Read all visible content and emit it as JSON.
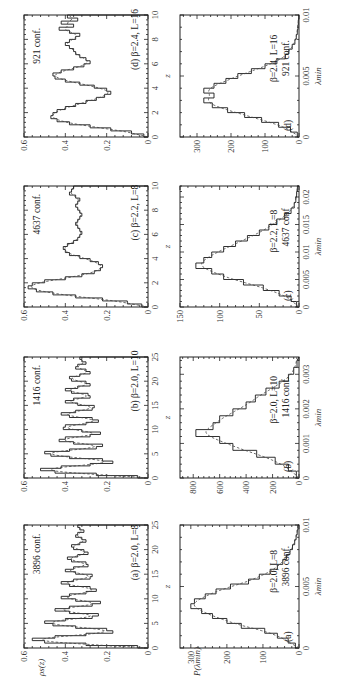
{
  "figure": {
    "rotation": "90deg counter-clockwise",
    "layout": "4 panel pairs (a)-(d), each with spectral density rho_s(z) and distribution P(lambda_min)"
  },
  "axes_labels": {
    "rho_ylabel": "ρs(z)",
    "rho_xlabel": "z",
    "p_ylabel": "P(λmin)",
    "p_xlabel": "λmin"
  },
  "chart_data": [
    {
      "type": "line",
      "panel": "(a)",
      "title": "β=2.0, L=8",
      "annotation": "3896 conf.",
      "xlabel": "z",
      "ylabel": "ρs(z)",
      "xlim": [
        0,
        25
      ],
      "ylim": [
        0,
        0.6
      ],
      "xticks": [
        0,
        5,
        10,
        15,
        20,
        25
      ],
      "yticks": [
        0,
        0.2,
        0.4,
        0.6
      ],
      "series": [
        {
          "name": "histogram",
          "x": [
            0,
            0.5,
            1,
            1.5,
            2,
            2.5,
            3,
            3.5,
            4,
            4.5,
            5,
            5.5,
            6,
            6.5,
            7,
            7.5,
            8,
            8.5,
            9,
            9.5,
            10,
            10.5,
            11,
            11.5,
            12,
            12.5,
            13,
            13.5,
            14,
            14.5,
            15,
            15.5,
            16,
            16.5,
            17,
            17.5,
            18,
            18.5,
            19,
            19.5,
            20,
            20.5,
            21,
            21.5,
            22,
            22.5,
            23,
            23.5,
            24,
            24.5
          ],
          "values": [
            0.05,
            0.3,
            0.5,
            0.56,
            0.45,
            0.3,
            0.17,
            0.2,
            0.35,
            0.46,
            0.5,
            0.4,
            0.27,
            0.24,
            0.38,
            0.45,
            0.38,
            0.27,
            0.23,
            0.35,
            0.42,
            0.38,
            0.3,
            0.25,
            0.28,
            0.38,
            0.42,
            0.36,
            0.28,
            0.27,
            0.35,
            0.4,
            0.36,
            0.29,
            0.3,
            0.37,
            0.39,
            0.34,
            0.29,
            0.31,
            0.36,
            0.37,
            0.33,
            0.3,
            0.32,
            0.35,
            0.34,
            0.31,
            0.33,
            0.34
          ]
        },
        {
          "name": "fit (dashed)",
          "style": "dashed"
        }
      ]
    },
    {
      "type": "bar",
      "panel": "(a)",
      "title": "β=2.0, L=8",
      "annotation": "3896 conf.",
      "xlabel": "λmin",
      "ylabel": "P(λmin)",
      "xlim": [
        0,
        0.01
      ],
      "ylim": [
        0,
        330
      ],
      "xticks": [
        0,
        0.005,
        0.01
      ],
      "yticks": [
        0,
        100,
        200,
        300
      ],
      "x": [
        0.0002,
        0.0006,
        0.001,
        0.0014,
        0.0018,
        0.0022,
        0.0026,
        0.003,
        0.0034,
        0.0038,
        0.0042,
        0.0046,
        0.005,
        0.0054,
        0.0058,
        0.0062,
        0.0066,
        0.007,
        0.0074,
        0.0078,
        0.0082,
        0.0086,
        0.009,
        0.0094,
        0.0098
      ],
      "values": [
        10,
        30,
        60,
        95,
        160,
        200,
        240,
        270,
        300,
        290,
        260,
        230,
        190,
        140,
        110,
        80,
        60,
        45,
        35,
        25,
        18,
        12,
        8,
        5,
        3
      ]
    },
    {
      "type": "line",
      "panel": "(b)",
      "title": "β=2.0, L=10",
      "annotation": "1416 conf.",
      "xlabel": "z",
      "ylabel": "ρs(z)",
      "xlim": [
        0,
        25
      ],
      "ylim": [
        0,
        0.6
      ],
      "xticks": [
        0,
        5,
        10,
        15,
        20,
        25
      ],
      "yticks": [
        0,
        0.2,
        0.4,
        0.6
      ],
      "series": [
        {
          "name": "histogram",
          "x": [
            0,
            0.5,
            1,
            1.5,
            2,
            2.5,
            3,
            3.5,
            4,
            4.5,
            5,
            5.5,
            6,
            6.5,
            7,
            7.5,
            8,
            8.5,
            9,
            9.5,
            10,
            10.5,
            11,
            11.5,
            12,
            12.5,
            13,
            13.5,
            14,
            14.5,
            15,
            15.5,
            16,
            16.5,
            17,
            17.5,
            18,
            18.5,
            19,
            19.5,
            20,
            20.5,
            21,
            21.5,
            22,
            22.5,
            23,
            23.5,
            24,
            24.5
          ],
          "values": [
            0.05,
            0.25,
            0.45,
            0.52,
            0.42,
            0.28,
            0.17,
            0.22,
            0.38,
            0.47,
            0.5,
            0.38,
            0.25,
            0.22,
            0.36,
            0.43,
            0.4,
            0.28,
            0.23,
            0.32,
            0.41,
            0.4,
            0.3,
            0.24,
            0.27,
            0.38,
            0.42,
            0.35,
            0.27,
            0.26,
            0.34,
            0.4,
            0.36,
            0.28,
            0.29,
            0.37,
            0.4,
            0.34,
            0.28,
            0.3,
            0.37,
            0.38,
            0.33,
            0.28,
            0.3,
            0.35,
            0.34,
            0.3,
            0.32,
            0.33
          ]
        },
        {
          "name": "fit (dashed)",
          "style": "dashed"
        }
      ]
    },
    {
      "type": "bar",
      "panel": "(b)",
      "title": "β=2.0, L=10",
      "annotation": "1416 conf.",
      "xlabel": "λmin",
      "ylabel": "P(λmin)",
      "xlim": [
        0,
        0.0035
      ],
      "ylim": [
        0,
        900
      ],
      "xticks": [
        0,
        0.001,
        0.002,
        0.003
      ],
      "yticks": [
        0,
        200,
        400,
        600,
        800
      ],
      "x": [
        0.0001,
        0.0003,
        0.0005,
        0.0007,
        0.0009,
        0.0011,
        0.0013,
        0.0015,
        0.0017,
        0.0019,
        0.0021,
        0.0023,
        0.0025,
        0.0027,
        0.0029,
        0.0031,
        0.0033
      ],
      "values": [
        20,
        80,
        180,
        320,
        500,
        600,
        780,
        650,
        600,
        500,
        400,
        330,
        250,
        150,
        80,
        40,
        15
      ]
    },
    {
      "type": "line",
      "panel": "(c)",
      "title": "β=2.2, L=8",
      "annotation": "4637 conf.",
      "xlabel": "z",
      "ylabel": "ρs(z)",
      "xlim": [
        0,
        10
      ],
      "ylim": [
        0,
        0.6
      ],
      "xticks": [
        0,
        2,
        4,
        6,
        8,
        10
      ],
      "yticks": [
        0,
        0.2,
        0.4,
        0.6
      ],
      "series": [
        {
          "name": "histogram",
          "x": [
            0,
            0.25,
            0.5,
            0.75,
            1,
            1.25,
            1.5,
            1.75,
            2,
            2.25,
            2.5,
            2.75,
            3,
            3.25,
            3.5,
            3.75,
            4,
            4.25,
            4.5,
            4.75,
            5,
            5.25,
            5.5,
            5.75,
            6,
            6.25,
            6.5,
            6.75,
            7,
            7.25,
            7.5,
            7.75,
            8,
            8.25,
            8.5,
            8.75,
            9,
            9.25,
            9.5,
            9.75
          ],
          "values": [
            0.03,
            0.1,
            0.22,
            0.35,
            0.46,
            0.54,
            0.58,
            0.56,
            0.5,
            0.4,
            0.32,
            0.26,
            0.23,
            0.22,
            0.24,
            0.28,
            0.33,
            0.38,
            0.4,
            0.41,
            0.39,
            0.36,
            0.34,
            0.33,
            0.32,
            0.33,
            0.34,
            0.35,
            0.34,
            0.33,
            0.32,
            0.33,
            0.34,
            0.35,
            0.34,
            0.33,
            0.35,
            0.38,
            0.37,
            0.36
          ]
        },
        {
          "name": "fit (dashed)",
          "style": "dashed"
        }
      ]
    },
    {
      "type": "bar",
      "panel": "(c)",
      "title": "β=2.2, L=8",
      "annotation": "4637 conf",
      "xlabel": "λmin",
      "ylabel": "P(λmin)",
      "xlim": [
        0,
        0.022
      ],
      "ylim": [
        0,
        150
      ],
      "xticks": [
        0,
        0.005,
        0.01,
        0.015,
        0.02
      ],
      "yticks": [
        0,
        50,
        100,
        150
      ],
      "x": [
        0.0005,
        0.0015,
        0.0025,
        0.0035,
        0.0045,
        0.0055,
        0.0065,
        0.0075,
        0.0085,
        0.0095,
        0.0105,
        0.0115,
        0.0125,
        0.0135,
        0.0145,
        0.0155,
        0.0165,
        0.0175,
        0.0185,
        0.0195,
        0.0205,
        0.0215
      ],
      "values": [
        3,
        10,
        25,
        45,
        70,
        95,
        110,
        130,
        120,
        110,
        95,
        80,
        65,
        50,
        38,
        28,
        18,
        10,
        6,
        4,
        3,
        2
      ]
    },
    {
      "type": "line",
      "panel": "(d)",
      "title": "β=2.4, L=16",
      "annotation": "921 conf.",
      "xlabel": "z",
      "ylabel": "ρs(z)",
      "xlim": [
        0,
        10
      ],
      "ylim": [
        0,
        0.6
      ],
      "xticks": [
        0,
        2,
        4,
        6,
        8,
        10
      ],
      "yticks": [
        0,
        0.2,
        0.4,
        0.6
      ],
      "series": [
        {
          "name": "histogram",
          "x": [
            0,
            0.25,
            0.5,
            0.75,
            1,
            1.25,
            1.5,
            1.75,
            2,
            2.25,
            2.5,
            2.75,
            3,
            3.25,
            3.5,
            3.75,
            4,
            4.25,
            4.5,
            4.75,
            5,
            5.25,
            5.5,
            5.75,
            6,
            6.25,
            6.5,
            6.75,
            7,
            7.25,
            7.5,
            7.75,
            8,
            8.25,
            8.5,
            8.75,
            9,
            9.25,
            9.5,
            9.75
          ],
          "values": [
            0.02,
            0.08,
            0.18,
            0.28,
            0.38,
            0.44,
            0.47,
            0.46,
            0.44,
            0.4,
            0.35,
            0.3,
            0.25,
            0.21,
            0.18,
            0.2,
            0.26,
            0.33,
            0.4,
            0.45,
            0.46,
            0.42,
            0.36,
            0.31,
            0.28,
            0.3,
            0.33,
            0.35,
            0.36,
            0.38,
            0.4,
            0.38,
            0.35,
            0.33,
            0.38,
            0.43,
            0.36,
            0.42,
            0.34,
            0.39
          ]
        },
        {
          "name": "fit (dashed)",
          "style": "dashed"
        }
      ]
    },
    {
      "type": "bar",
      "panel": "(d)",
      "title": "β=2.4, L=16",
      "annotation": "921 conf.",
      "xlabel": "λmin",
      "ylabel": "P(λmin)",
      "xlim": [
        0,
        0.01
      ],
      "ylim": [
        0,
        350
      ],
      "xticks": [
        0,
        0.005,
        0.01
      ],
      "yticks": [
        0,
        100,
        200,
        300
      ],
      "x": [
        0.0002,
        0.0006,
        0.001,
        0.0014,
        0.0018,
        0.0022,
        0.0026,
        0.003,
        0.0034,
        0.0038,
        0.0042,
        0.0046,
        0.005,
        0.0054,
        0.0058,
        0.0062,
        0.0066,
        0.007,
        0.0074,
        0.0078,
        0.0082,
        0.0086,
        0.009,
        0.0094,
        0.0098
      ],
      "values": [
        5,
        25,
        60,
        110,
        160,
        210,
        255,
        280,
        250,
        280,
        250,
        215,
        180,
        140,
        100,
        65,
        40,
        30,
        20,
        12,
        8,
        5,
        3,
        2,
        1
      ]
    }
  ]
}
